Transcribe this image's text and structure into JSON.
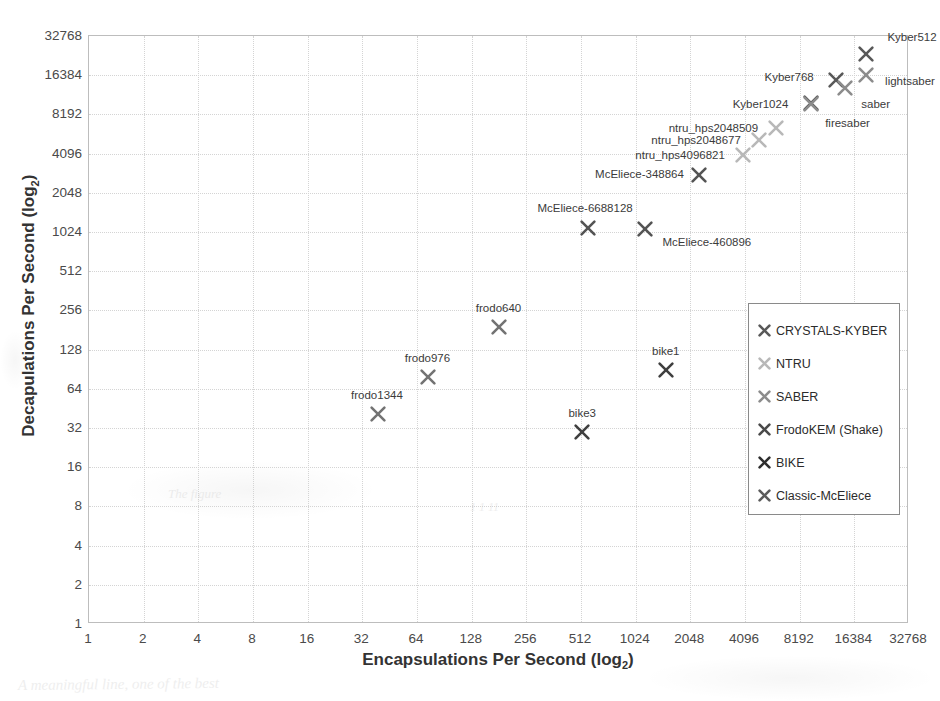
{
  "chart_data": {
    "type": "scatter",
    "title": "",
    "xlabel": "Encapsulations Per Second (log2)",
    "ylabel": "Decapulations Per Second (log2)",
    "xlabel_main": "Encapsulations Per Second (log",
    "xlabel_sub": "2",
    "xlabel_tail": ")",
    "ylabel_main": "Decapulations Per Second (log",
    "ylabel_sub": "2",
    "ylabel_tail": ")",
    "grid": true,
    "xscale": "log2",
    "yscale": "log2",
    "xlim": [
      1,
      32768
    ],
    "ylim": [
      1,
      32768
    ],
    "xticks": [
      "1",
      "2",
      "4",
      "8",
      "16",
      "32",
      "64",
      "128",
      "256",
      "512",
      "1024",
      "2048",
      "4096",
      "8192",
      "16384",
      "32768"
    ],
    "yticks": [
      "1",
      "2",
      "4",
      "8",
      "16",
      "32",
      "64",
      "128",
      "256",
      "512",
      "1024",
      "2048",
      "4096",
      "8192",
      "16384",
      "32768"
    ],
    "legend_position": "center-right",
    "series": [
      {
        "name": "CRYSTALS-KYBER",
        "color": "#595959",
        "points": [
          {
            "label": "Kyber512",
            "x": 19000,
            "y": 24000,
            "label_dx": 46,
            "label_dy": -17
          },
          {
            "label": "Kyber768",
            "x": 13000,
            "y": 15000,
            "label_dx": -47,
            "label_dy": -3
          },
          {
            "label": "Kyber1024",
            "x": 9400,
            "y": 10000,
            "label_dx": -50,
            "label_dy": 1
          }
        ]
      },
      {
        "name": "NTRU",
        "color": "#b8b8b8",
        "points": [
          {
            "label": "ntru_hps2048509",
            "x": 6100,
            "y": 6400,
            "label_dx": -63,
            "label_dy": 0
          },
          {
            "label": "ntru_hps2048677",
            "x": 4900,
            "y": 5200,
            "label_dx": -63,
            "label_dy": 0
          },
          {
            "label": "ntru_hps4096821",
            "x": 4000,
            "y": 4000,
            "label_dx": -63,
            "label_dy": 0
          }
        ]
      },
      {
        "name": "SABER",
        "color": "#8c8c8c",
        "points": [
          {
            "label": "lightsaber",
            "x": 19000,
            "y": 16500,
            "label_dx": 44,
            "label_dy": 6
          },
          {
            "label": "saber",
            "x": 14500,
            "y": 13000,
            "label_dx": 31,
            "label_dy": 16
          },
          {
            "label": "firesaber",
            "x": 9400,
            "y": 9800,
            "label_dx": 37,
            "label_dy": 19
          }
        ]
      },
      {
        "name": "FrodoKEM (Shake)",
        "color": "#737373",
        "points": [
          {
            "label": "frodo640",
            "x": 180,
            "y": 190,
            "label_dx": 0,
            "label_dy": -19
          },
          {
            "label": "frodo976",
            "x": 74,
            "y": 79,
            "label_dx": -1,
            "label_dy": -19
          },
          {
            "label": "frodo1344",
            "x": 39,
            "y": 41,
            "label_dx": -1,
            "label_dy": -19
          }
        ]
      },
      {
        "name": "BIKE",
        "color": "#3f3f3f",
        "points": [
          {
            "label": "bike1",
            "x": 1500,
            "y": 90,
            "label_dx": 0,
            "label_dy": -19
          },
          {
            "label": "bike3",
            "x": 520,
            "y": 30,
            "label_dx": 0,
            "label_dy": -19
          }
        ]
      },
      {
        "name": "Classic-McEliece",
        "color": "#545454",
        "points": [
          {
            "label": "McEliece-348864",
            "x": 2300,
            "y": 2800,
            "label_dx": -60,
            "label_dy": -1
          },
          {
            "label": "McEliece-6688128",
            "x": 560,
            "y": 1100,
            "label_dx": -3,
            "label_dy": -20
          },
          {
            "label": "McEliece-460896",
            "x": 1150,
            "y": 1080,
            "label_dx": 62,
            "label_dy": 13
          }
        ]
      }
    ]
  },
  "legend": {
    "items": [
      {
        "label": "CRYSTALS-KYBER",
        "color": "#595959",
        "marker": "cross-x-icon"
      },
      {
        "label": "NTRU",
        "color": "#b8b8b8",
        "marker": "cross-x-icon"
      },
      {
        "label": "SABER",
        "color": "#8c8c8c",
        "marker": "cross-x-icon"
      },
      {
        "label": "FrodoKEM (Shake)",
        "color": "#4a4a4a",
        "marker": "cross-x-icon"
      },
      {
        "label": "BIKE",
        "color": "#2e2e2e",
        "marker": "cross-x-icon"
      },
      {
        "label": "Classic-McEliece",
        "color": "#5c5c5c",
        "marker": "cross-x-icon"
      }
    ]
  },
  "scan_artifacts": [
    {
      "text": "A meaningful line, one of the best",
      "x": 18,
      "y": 676,
      "size": 15,
      "rot": -0.6
    },
    {
      "text": "The figure",
      "x": 168,
      "y": 486,
      "size": 13,
      "rot": 0
    },
    {
      "text": "1 1 11",
      "x": 470,
      "y": 500,
      "size": 12,
      "rot": 0
    }
  ]
}
